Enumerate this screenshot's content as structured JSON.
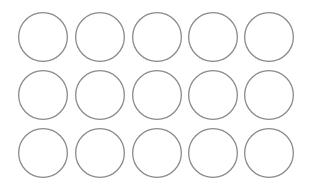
{
  "grid": {
    "rows": 3,
    "cols": 5,
    "diameter": 50,
    "stroke_color": "#8a8a8a",
    "stroke_width": 1.3,
    "fill_color": "#ffffff",
    "col_centers": [
      43,
      100,
      157,
      213,
      269
    ],
    "row_centers": [
      37,
      95,
      153
    ]
  }
}
